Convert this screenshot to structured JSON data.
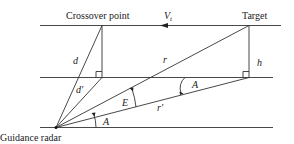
{
  "diagram": {
    "labels": {
      "crossover": "Crossover point",
      "target": "Target",
      "radar": "Guidance radar",
      "velocity": "V",
      "velocity_sub": "t",
      "d": "d",
      "d_prime": "d'",
      "r": "r",
      "r_prime": "r'",
      "h": "h",
      "E": "E",
      "A_upper": "A",
      "A_lower": "A"
    },
    "points": {
      "radar": [
        56,
        127
      ],
      "crossover": [
        102,
        25
      ],
      "crossover_foot": [
        102,
        77
      ],
      "target": [
        249,
        26
      ],
      "target_foot": [
        249,
        77
      ]
    },
    "colors": {
      "line": "#333333",
      "text": "#222222"
    }
  }
}
